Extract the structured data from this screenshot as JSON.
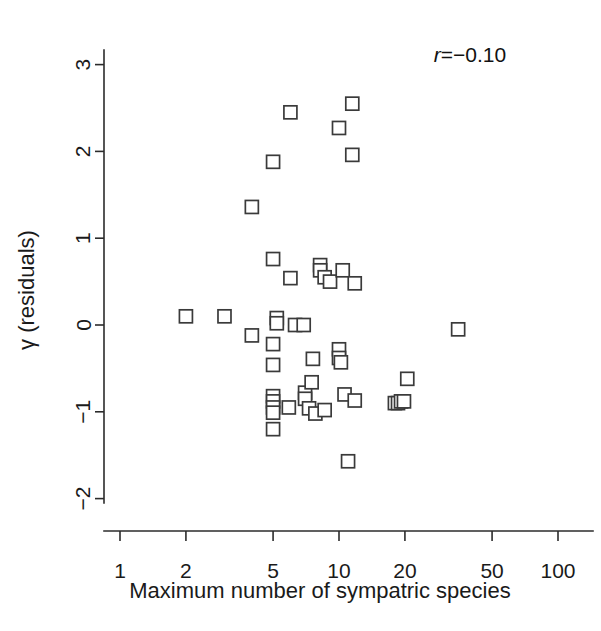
{
  "figure": {
    "width": 601,
    "height": 631,
    "background": "#ffffff",
    "marker_color": "#3a3a3a",
    "axis_color": "#2b2b2b"
  },
  "annotation": {
    "r_symbol": "r",
    "r_equals_value": "=−0.10",
    "full_text": "r=−0.10"
  },
  "chart_data": {
    "type": "scatter",
    "title": "",
    "xlabel": "Maximum number of sympatric species",
    "ylabel": "γ (residuals)",
    "xscale": "log",
    "yscale": "linear",
    "xlim": [
      1,
      100
    ],
    "ylim": [
      -2.35,
      3.2
    ],
    "grid": false,
    "legend": null,
    "annotations": [
      {
        "text": "r=−0.10",
        "x_rel": 0.78,
        "y_value": 2.85
      }
    ],
    "xticks": [
      1,
      2,
      5,
      10,
      20,
      50,
      100
    ],
    "xticklabels": [
      "1",
      "2",
      "5",
      "10",
      "20",
      "50",
      "100"
    ],
    "yticks": [
      -2,
      -1,
      0,
      1,
      2,
      3
    ],
    "yticklabels": [
      "−2",
      "−1",
      "0",
      "1",
      "2",
      "3"
    ],
    "marker": "open-square",
    "n_points": 58,
    "correlation_r": -0.1,
    "points": [
      {
        "x": 2.0,
        "y": 0.1
      },
      {
        "x": 3.0,
        "y": 0.1
      },
      {
        "x": 4.0,
        "y": -0.12
      },
      {
        "x": 4.0,
        "y": 1.36
      },
      {
        "x": 5.0,
        "y": 1.88
      },
      {
        "x": 5.0,
        "y": 0.76
      },
      {
        "x": 5.0,
        "y": -0.22
      },
      {
        "x": 5.0,
        "y": -0.46
      },
      {
        "x": 5.0,
        "y": -0.82
      },
      {
        "x": 5.0,
        "y": -0.88
      },
      {
        "x": 5.0,
        "y": -0.95
      },
      {
        "x": 5.0,
        "y": -1.01
      },
      {
        "x": 5.0,
        "y": -1.2
      },
      {
        "x": 5.2,
        "y": 0.08
      },
      {
        "x": 5.2,
        "y": 0.02
      },
      {
        "x": 6.0,
        "y": 2.45
      },
      {
        "x": 6.0,
        "y": 0.54
      },
      {
        "x": 5.9,
        "y": -0.95
      },
      {
        "x": 6.3,
        "y": 0.0
      },
      {
        "x": 6.9,
        "y": 0.0
      },
      {
        "x": 7.0,
        "y": -0.78
      },
      {
        "x": 7.0,
        "y": -0.85
      },
      {
        "x": 7.3,
        "y": -0.96
      },
      {
        "x": 7.5,
        "y": -0.66
      },
      {
        "x": 7.6,
        "y": -0.39
      },
      {
        "x": 7.8,
        "y": -1.02
      },
      {
        "x": 8.2,
        "y": 0.69
      },
      {
        "x": 8.2,
        "y": 0.63
      },
      {
        "x": 8.6,
        "y": 0.55
      },
      {
        "x": 8.6,
        "y": -0.98
      },
      {
        "x": 9.1,
        "y": 0.5
      },
      {
        "x": 10.0,
        "y": 2.27
      },
      {
        "x": 10.0,
        "y": -0.28
      },
      {
        "x": 10.0,
        "y": -0.38
      },
      {
        "x": 10.2,
        "y": -0.43
      },
      {
        "x": 10.4,
        "y": 0.63
      },
      {
        "x": 10.6,
        "y": -0.8
      },
      {
        "x": 11.0,
        "y": -1.57
      },
      {
        "x": 11.5,
        "y": 2.55
      },
      {
        "x": 11.5,
        "y": 1.96
      },
      {
        "x": 11.8,
        "y": 0.48
      },
      {
        "x": 11.8,
        "y": -0.87
      },
      {
        "x": 18.0,
        "y": -0.9
      },
      {
        "x": 18.6,
        "y": -0.9
      },
      {
        "x": 19.2,
        "y": -0.88
      },
      {
        "x": 19.8,
        "y": -0.88
      },
      {
        "x": 20.5,
        "y": -0.62
      },
      {
        "x": 35.0,
        "y": -0.05
      }
    ]
  }
}
